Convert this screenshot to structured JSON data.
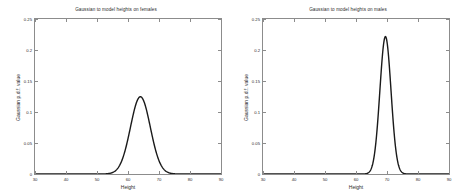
{
  "figure": {
    "background": "#ffffff",
    "axis_color": "#8c8c8c",
    "curve_color": "#1a1a1a"
  },
  "chart_data": [
    {
      "type": "line",
      "title": "Gaussian to model heights on females",
      "xlabel": "Height",
      "ylabel": "Gaussian p.d.f. value",
      "xlim": [
        30,
        90
      ],
      "ylim": [
        0,
        0.25
      ],
      "xticks": [
        30,
        40,
        50,
        60,
        70,
        80,
        90
      ],
      "xticklabels": [
        "30",
        "40",
        "50",
        "60",
        "70",
        "80",
        "90"
      ],
      "yticks": [
        0,
        0.05,
        0.1,
        0.15,
        0.2,
        0.25
      ],
      "yticklabels": [
        "0",
        "0.05",
        "0.1",
        "0.15",
        "0.2",
        "0.25"
      ],
      "grid": false,
      "legend": null,
      "series": [
        {
          "name": "female height pdf",
          "distribution": "gaussian",
          "mean": 64,
          "std": 3.2,
          "peak_value": 0.1247,
          "peak_x": 64,
          "x": [
            30,
            34,
            38,
            42,
            46,
            50,
            52,
            54,
            55,
            56,
            57,
            58,
            59,
            60,
            61,
            62,
            63,
            64,
            65,
            66,
            67,
            68,
            69,
            70,
            71,
            72,
            73,
            74,
            76,
            78,
            82,
            86,
            90
          ],
          "values": [
            0,
            0,
            0,
            0,
            0,
            0.0,
            0.0001,
            0.0006,
            0.0013,
            0.0028,
            0.0054,
            0.0099,
            0.0168,
            0.0265,
            0.0386,
            0.0518,
            0.0641,
            0.0712,
            0.0712,
            0.0641,
            0.0518,
            0.0386,
            0.0265,
            0.0168,
            0.0099,
            0.0054,
            0.0028,
            0.0013,
            0.0002,
            0.0,
            0,
            0,
            0
          ]
        }
      ]
    },
    {
      "type": "line",
      "title": "Gaussian to model heights on males",
      "xlabel": "Height",
      "ylabel": "Gaussian p.d.f. value",
      "xlim": [
        30,
        90
      ],
      "ylim": [
        0,
        0.25
      ],
      "xticks": [
        30,
        40,
        50,
        60,
        70,
        80,
        90
      ],
      "xticklabels": [
        "30",
        "40",
        "50",
        "60",
        "70",
        "80",
        "90"
      ],
      "yticks": [
        0,
        0.05,
        0.1,
        0.15,
        0.2,
        0.25
      ],
      "yticklabels": [
        "0",
        "0.05",
        "0.1",
        "0.15",
        "0.2",
        "0.25"
      ],
      "grid": false,
      "legend": null,
      "series": [
        {
          "name": "male height pdf",
          "distribution": "gaussian",
          "mean": 69.5,
          "std": 1.8,
          "peak_value": 0.2216,
          "peak_x": 69.5,
          "x": [
            30,
            40,
            50,
            58,
            62,
            64,
            65,
            66,
            66.5,
            67,
            67.5,
            68,
            68.5,
            69,
            69.5,
            70,
            70.5,
            71,
            71.5,
            72,
            72.5,
            73,
            74,
            75,
            76,
            78,
            82,
            86,
            90
          ],
          "values": [
            0,
            0,
            0,
            0,
            0.0001,
            0.0016,
            0.0042,
            0.0098,
            0.0145,
            0.0205,
            0.0278,
            0.036,
            0.0445,
            0.0525,
            0.0588,
            0.0525,
            0.0445,
            0.036,
            0.0278,
            0.0205,
            0.0145,
            0.0098,
            0.0042,
            0.0016,
            0.0005,
            0.0,
            0,
            0,
            0
          ]
        }
      ]
    }
  ],
  "panels": [
    {
      "id": "females",
      "title": "Gaussian to model heights on females",
      "xlabel": "Height",
      "ylabel": "Gaussian p.d.f. value",
      "xticklabels": [
        "30",
        "40",
        "50",
        "60",
        "70",
        "80",
        "90"
      ],
      "yticklabels": [
        "0",
        "0.05",
        "0.1",
        "0.15",
        "0.2",
        "0.25"
      ]
    },
    {
      "id": "males",
      "title": "Gaussian to model heights on males",
      "xlabel": "Height",
      "ylabel": "Gaussian p.d.f. value",
      "xticklabels": [
        "30",
        "40",
        "50",
        "60",
        "70",
        "80",
        "90"
      ],
      "yticklabels": [
        "0",
        "0.05",
        "0.1",
        "0.15",
        "0.2",
        "0.25"
      ]
    }
  ]
}
